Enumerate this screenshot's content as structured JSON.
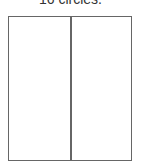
{
  "caption": "16 circles.",
  "diagram": {
    "type": "rectangle-split-vertical",
    "columns": 2,
    "stroke_color": "#666666",
    "background": "#ffffff"
  }
}
